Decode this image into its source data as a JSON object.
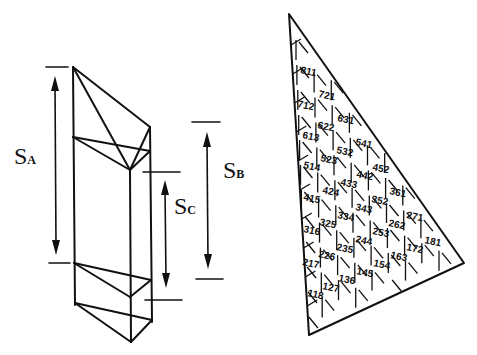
{
  "left_figure": {
    "labels": {
      "sa": {
        "main": "S",
        "sub": "A"
      },
      "sb": {
        "main": "S",
        "sub": "B"
      },
      "sc": {
        "main": "S",
        "sub": "C"
      }
    }
  },
  "right_figure": {
    "cells": [
      {
        "text": "811",
        "x": 300,
        "y": 73,
        "r": 12
      },
      {
        "text": "721",
        "x": 318,
        "y": 97,
        "r": 12
      },
      {
        "text": "712",
        "x": 297,
        "y": 107,
        "r": 12
      },
      {
        "text": "631",
        "x": 337,
        "y": 121,
        "r": 12
      },
      {
        "text": "622",
        "x": 317,
        "y": 128,
        "r": 12
      },
      {
        "text": "613",
        "x": 302,
        "y": 138,
        "r": 12
      },
      {
        "text": "541",
        "x": 355,
        "y": 145,
        "r": 12
      },
      {
        "text": "532",
        "x": 336,
        "y": 153,
        "r": 12
      },
      {
        "text": "523",
        "x": 320,
        "y": 161,
        "r": 12
      },
      {
        "text": "514",
        "x": 303,
        "y": 168,
        "r": 12
      },
      {
        "text": "452",
        "x": 372,
        "y": 170,
        "r": 12
      },
      {
        "text": "442",
        "x": 356,
        "y": 177,
        "r": 12
      },
      {
        "text": "433",
        "x": 340,
        "y": 185,
        "r": 12
      },
      {
        "text": "424",
        "x": 322,
        "y": 193,
        "r": 12
      },
      {
        "text": "415",
        "x": 303,
        "y": 200,
        "r": 12
      },
      {
        "text": "361",
        "x": 389,
        "y": 194,
        "r": 12
      },
      {
        "text": "352",
        "x": 371,
        "y": 202,
        "r": 12
      },
      {
        "text": "343",
        "x": 355,
        "y": 210,
        "r": 12
      },
      {
        "text": "334",
        "x": 337,
        "y": 218,
        "r": 12
      },
      {
        "text": "325",
        "x": 319,
        "y": 225,
        "r": 12
      },
      {
        "text": "316",
        "x": 303,
        "y": 232,
        "r": 12
      },
      {
        "text": "271",
        "x": 406,
        "y": 218,
        "r": 12
      },
      {
        "text": "262",
        "x": 388,
        "y": 226,
        "r": 12
      },
      {
        "text": "253",
        "x": 372,
        "y": 234,
        "r": 12
      },
      {
        "text": "244",
        "x": 355,
        "y": 242,
        "r": 12
      },
      {
        "text": "235",
        "x": 336,
        "y": 250,
        "r": 12
      },
      {
        "text": "226",
        "x": 318,
        "y": 257,
        "r": 12
      },
      {
        "text": "217",
        "x": 302,
        "y": 265,
        "r": 12
      },
      {
        "text": "181",
        "x": 424,
        "y": 243,
        "r": 12
      },
      {
        "text": "172",
        "x": 406,
        "y": 250,
        "r": 12
      },
      {
        "text": "163",
        "x": 390,
        "y": 258,
        "r": 12
      },
      {
        "text": "154",
        "x": 373,
        "y": 266,
        "r": 12
      },
      {
        "text": "145",
        "x": 356,
        "y": 274,
        "r": 12
      },
      {
        "text": "136",
        "x": 338,
        "y": 281,
        "r": 12
      },
      {
        "text": "127",
        "x": 322,
        "y": 289,
        "r": 12
      },
      {
        "text": "118",
        "x": 307,
        "y": 296,
        "r": 12
      }
    ]
  }
}
